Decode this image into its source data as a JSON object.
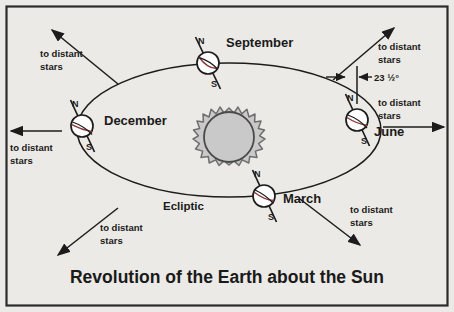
{
  "diagram": {
    "title": "Revolution of the Earth about the Sun",
    "frame_color": "#2b2b2b",
    "background_color": "#eceae6",
    "ink_color": "#1c1c1c",
    "sun": {
      "name": "Sun",
      "body_color": "#c9c9c9",
      "ray_color": "#8c8c8c",
      "center": {
        "x": 229,
        "y": 143
      },
      "radius": 26,
      "ray_count": 18
    },
    "orbit": {
      "label": "Ecliptic",
      "center": {
        "x": 229,
        "y": 130
      },
      "radius_x": 152,
      "radius_y": 67
    },
    "axis_tilt": {
      "value": "23 ½°",
      "description": "Earth axial tilt relative to the ecliptic normal"
    },
    "pole_labels": {
      "north": "N",
      "south": "S"
    },
    "earth_positions": [
      {
        "month": "September",
        "label_x": 226,
        "label_y": 47,
        "center": {
          "x": 208,
          "y": 63
        },
        "radius": 11
      },
      {
        "month": "December",
        "label_x": 104,
        "label_y": 125,
        "center": {
          "x": 82,
          "y": 126
        },
        "radius": 11
      },
      {
        "month": "June",
        "label_x": 374,
        "label_y": 136,
        "center": {
          "x": 357,
          "y": 120
        },
        "radius": 11
      },
      {
        "month": "March",
        "label_x": 283,
        "label_y": 203,
        "center": {
          "x": 264,
          "y": 196
        },
        "radius": 11
      }
    ],
    "star_arrows": [
      {
        "id": "top-left",
        "line1": "to distant",
        "line2": "stars",
        "text_x": 40,
        "text_y": 57,
        "from": {
          "x": 118,
          "y": 84
        },
        "to": {
          "x": 52,
          "y": 30
        }
      },
      {
        "id": "left",
        "line1": "to distant",
        "line2": "stars",
        "text_x": 9,
        "text_y": 151,
        "from": {
          "x": 62,
          "y": 131
        },
        "to": {
          "x": 10,
          "y": 131
        }
      },
      {
        "id": "top-right",
        "line1": "to distant",
        "line2": "stars",
        "text_x": 378,
        "text_y": 50,
        "from": {
          "x": 333,
          "y": 80
        },
        "to": {
          "x": 394,
          "y": 28
        }
      },
      {
        "id": "right",
        "line1": "to distant",
        "line2": "stars",
        "text_x": 378,
        "text_y": 106,
        "from": {
          "x": 383,
          "y": 127
        },
        "to": {
          "x": 444,
          "y": 127
        }
      },
      {
        "id": "bottom-left",
        "line1": "to distant",
        "line2": "stars",
        "text_x": 100,
        "text_y": 231,
        "from": {
          "x": 118,
          "y": 208
        },
        "to": {
          "x": 58,
          "y": 255
        }
      },
      {
        "id": "bottom-right",
        "line1": "to distant",
        "line2": "stars",
        "text_x": 350,
        "text_y": 213,
        "from": {
          "x": 300,
          "y": 199
        },
        "to": {
          "x": 360,
          "y": 245
        }
      }
    ]
  }
}
